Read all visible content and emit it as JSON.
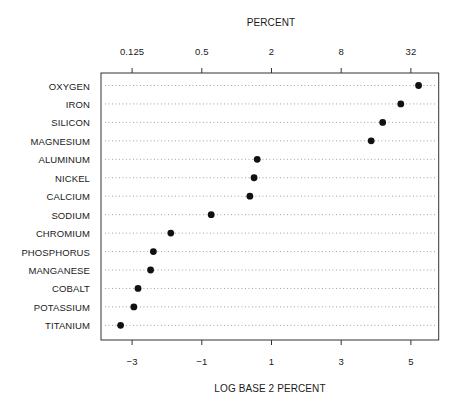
{
  "chart_data": {
    "type": "dot",
    "title": "",
    "top_axis": {
      "label": "PERCENT",
      "ticks": [
        0.125,
        0.5,
        2,
        8,
        32
      ],
      "tick_labels": [
        "0.125",
        "0.5",
        "2",
        "8",
        "32"
      ]
    },
    "bottom_axis": {
      "label": "LOG BASE 2 PERCENT",
      "ticks": [
        -3,
        -1,
        1,
        3,
        5
      ],
      "tick_labels": [
        "−3",
        "−1",
        "1",
        "3",
        "5"
      ]
    },
    "xlim_log2": [
      -3.9,
      5.9
    ],
    "grid": "dotted horizontal guide lines per category",
    "legend": "none",
    "categories": [
      "OXYGEN",
      "IRON",
      "SILICON",
      "MAGNESIUM",
      "ALUMINUM",
      "NICKEL",
      "CALCIUM",
      "SODIUM",
      "CHROMIUM",
      "PHOSPHORUS",
      "MANGANESE",
      "COBALT",
      "POTASSIUM",
      "TITANIUM"
    ],
    "values_log2": [
      5.22,
      4.71,
      4.19,
      3.86,
      0.59,
      0.5,
      0.38,
      -0.73,
      -1.89,
      -2.39,
      -2.47,
      -2.83,
      -2.95,
      -3.33
    ],
    "values_percent": [
      37.3,
      26.2,
      18.3,
      14.5,
      1.5,
      1.41,
      1.3,
      0.6,
      0.27,
      0.19,
      0.18,
      0.14,
      0.13,
      0.1
    ]
  },
  "labels": {
    "top_title": "PERCENT",
    "bottom_title": "LOG BASE 2 PERCENT"
  },
  "colors": {
    "dot": "#111111",
    "frame": "#333333",
    "guide": "#8a8a8a"
  }
}
